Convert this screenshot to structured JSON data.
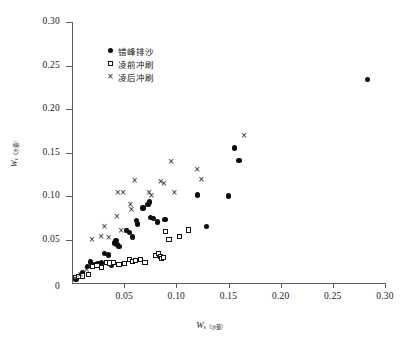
{
  "chart_data": {
    "type": "scatter",
    "title": "",
    "xlabel": "W s（沙量）",
    "xlabel_main": "W",
    "xlabel_sub": "s（沙量）",
    "ylabel": "W c（水量）",
    "ylabel_main": "W",
    "ylabel_sub": "c（水量）",
    "xlim": [
      0,
      0.3
    ],
    "ylim": [
      0,
      0.3
    ],
    "xticks": [
      0,
      0.05,
      0.1,
      0.15,
      0.2,
      0.25,
      0.3
    ],
    "yticks": [
      0,
      0.05,
      0.1,
      0.15,
      0.2,
      0.25,
      0.3
    ],
    "xtick_labels": [
      "0",
      "0.05",
      "0.10",
      "0.15",
      "0.20",
      "0.25",
      "0.30"
    ],
    "ytick_labels": [
      "0",
      "0.05",
      "0.10",
      "0.15",
      "0.20",
      "0.25",
      "0.30"
    ],
    "grid": false,
    "legend_position": "upper-left-inside",
    "series": [
      {
        "name": "错峰排沙",
        "marker": "filled-circle",
        "color": "#0d0d0d",
        "points": [
          [
            0.004,
            0.004
          ],
          [
            0.008,
            0.008
          ],
          [
            0.01,
            0.012
          ],
          [
            0.015,
            0.019
          ],
          [
            0.018,
            0.024
          ],
          [
            0.022,
            0.021
          ],
          [
            0.025,
            0.022
          ],
          [
            0.028,
            0.023
          ],
          [
            0.031,
            0.034
          ],
          [
            0.035,
            0.032
          ],
          [
            0.038,
            0.02
          ],
          [
            0.041,
            0.046
          ],
          [
            0.042,
            0.049
          ],
          [
            0.043,
            0.044
          ],
          [
            0.045,
            0.042
          ],
          [
            0.052,
            0.06
          ],
          [
            0.055,
            0.058
          ],
          [
            0.058,
            0.053
          ],
          [
            0.062,
            0.072
          ],
          [
            0.063,
            0.068
          ],
          [
            0.068,
            0.086
          ],
          [
            0.073,
            0.09
          ],
          [
            0.074,
            0.093
          ],
          [
            0.075,
            0.075
          ],
          [
            0.078,
            0.074
          ],
          [
            0.082,
            0.07
          ],
          [
            0.089,
            0.073
          ],
          [
            0.12,
            0.101
          ],
          [
            0.129,
            0.065
          ],
          [
            0.15,
            0.1
          ],
          [
            0.156,
            0.155
          ],
          [
            0.16,
            0.141
          ],
          [
            0.283,
            0.234
          ]
        ]
      },
      {
        "name": "凌前冲刷",
        "marker": "open-square",
        "color": "#151515",
        "points": [
          [
            0.003,
            0.006
          ],
          [
            0.006,
            0.007
          ],
          [
            0.01,
            0.008
          ],
          [
            0.016,
            0.01
          ],
          [
            0.02,
            0.019
          ],
          [
            0.024,
            0.02
          ],
          [
            0.028,
            0.018
          ],
          [
            0.033,
            0.024
          ],
          [
            0.036,
            0.023
          ],
          [
            0.04,
            0.024
          ],
          [
            0.045,
            0.021
          ],
          [
            0.05,
            0.022
          ],
          [
            0.055,
            0.027
          ],
          [
            0.058,
            0.025
          ],
          [
            0.061,
            0.026
          ],
          [
            0.066,
            0.027
          ],
          [
            0.07,
            0.024
          ],
          [
            0.08,
            0.032
          ],
          [
            0.083,
            0.034
          ],
          [
            0.085,
            0.03
          ],
          [
            0.086,
            0.028
          ],
          [
            0.088,
            0.029
          ],
          [
            0.09,
            0.059
          ],
          [
            0.093,
            0.05
          ],
          [
            0.103,
            0.053
          ],
          [
            0.112,
            0.061
          ]
        ]
      },
      {
        "name": "凌后冲刷",
        "marker": "cross",
        "color": "#111111",
        "points": [
          [
            0.003,
            0.005
          ],
          [
            0.008,
            0.01
          ],
          [
            0.014,
            0.016
          ],
          [
            0.019,
            0.05
          ],
          [
            0.028,
            0.053
          ],
          [
            0.031,
            0.065
          ],
          [
            0.035,
            0.052
          ],
          [
            0.043,
            0.077
          ],
          [
            0.044,
            0.104
          ],
          [
            0.047,
            0.06
          ],
          [
            0.049,
            0.104
          ],
          [
            0.052,
            0.06
          ],
          [
            0.056,
            0.09
          ],
          [
            0.057,
            0.084
          ],
          [
            0.06,
            0.118
          ],
          [
            0.074,
            0.104
          ],
          [
            0.076,
            0.101
          ],
          [
            0.085,
            0.117
          ],
          [
            0.088,
            0.114
          ],
          [
            0.095,
            0.14
          ],
          [
            0.098,
            0.104
          ],
          [
            0.12,
            0.131
          ],
          [
            0.124,
            0.119
          ],
          [
            0.165,
            0.17
          ]
        ]
      }
    ]
  },
  "legend": {
    "items": [
      {
        "label": "错峰排沙",
        "marker": "filled-circle"
      },
      {
        "label": "凌前冲刷",
        "marker": "open-square"
      },
      {
        "label": "凌后冲刷",
        "marker": "cross"
      }
    ]
  },
  "axes": {
    "y_title_main": "W",
    "y_title_sub": "c（水量）",
    "x_title_main": "W",
    "x_title_sub": "s（沙量）"
  }
}
